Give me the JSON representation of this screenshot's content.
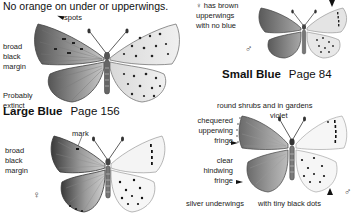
{
  "top_left": {
    "heading": "No orange on under or upperwings.",
    "annotations": {
      "spots": "spots",
      "margin": "broad\nblack\nmargin",
      "status": "Probably\nextinct"
    }
  },
  "large_blue": {
    "name": "Large Blue",
    "page": "Page 156",
    "annotations": {
      "mark": "mark",
      "margin": "broad\nblack\nmargin",
      "sex_symbol": "♀"
    }
  },
  "small_blue": {
    "name": "Small Blue",
    "page": "Page 84",
    "annotations": {
      "female_note": "♀ has brown\nupperwings\nwith no blue",
      "sex_symbol": "♂"
    }
  },
  "bottom_right": {
    "habitat_note": "round shrubs and in gardens",
    "species_word": "violet",
    "annotations": {
      "chequered": "chequered\nupperwing\nfringe",
      "clear": "clear\nhindwing\nfringe",
      "underwings": "silver underwings",
      "dots": "with tiny black dots",
      "sex_symbol": "♂"
    }
  },
  "colors": {
    "text": "#1a1a1a",
    "wing_dark": "#6e6e6e",
    "wing_light": "#e6e6e6",
    "background": "#ffffff"
  }
}
